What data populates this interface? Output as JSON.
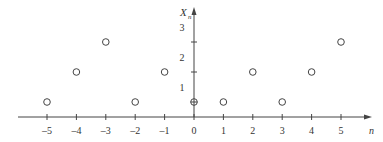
{
  "chart_data": {
    "type": "scatter",
    "title": "",
    "xlabel": "n",
    "ylabel": "X_n",
    "x": [
      -5,
      -4,
      -3,
      -2,
      -1,
      0,
      1,
      2,
      3,
      4,
      5
    ],
    "values": [
      0.5,
      1.5,
      2.5,
      0.5,
      1.5,
      0.5,
      0.5,
      1.5,
      0.5,
      1.5,
      2.5
    ],
    "highlight_index": 5,
    "x_ticks": [
      "-5",
      "-4",
      "-3",
      "-2",
      "-1",
      "0",
      "1",
      "2",
      "3",
      "4",
      "5"
    ],
    "y_tick_labels": [
      "1",
      "2",
      "3"
    ],
    "y_tick_marks": [
      1.5,
      2.5
    ],
    "xlim": [
      -5.9,
      6.0
    ],
    "ylim": [
      0,
      3.8
    ],
    "grid": false,
    "legend": null
  },
  "labels": {
    "x_axis": "n",
    "y_axis_main": "X",
    "y_axis_sub": "n"
  }
}
